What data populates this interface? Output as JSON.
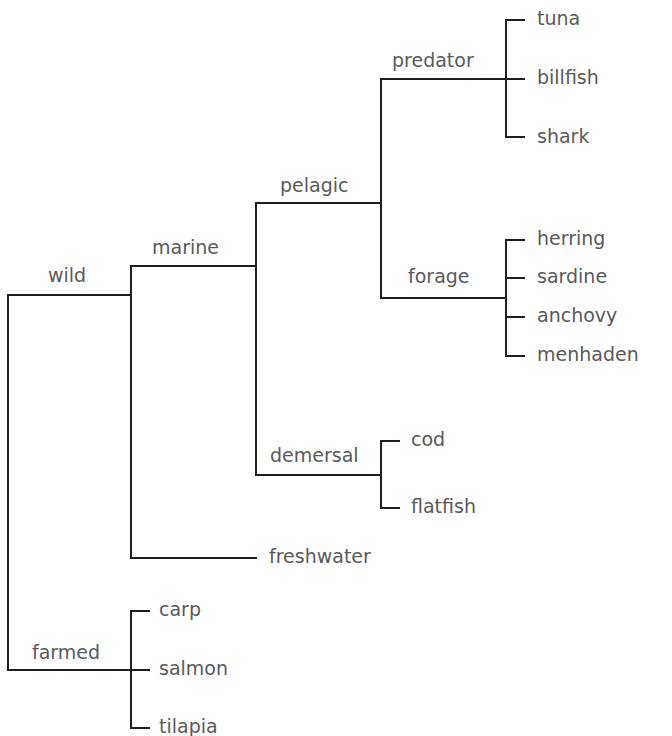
{
  "diagram": {
    "type": "tree",
    "orientation": "left-to-right",
    "colors": {
      "line": "#1f1f1f",
      "text": "#5a5a5a",
      "background": "#ffffff"
    },
    "root": {
      "children": [
        {
          "label": "wild",
          "children": [
            {
              "label": "marine",
              "children": [
                {
                  "label": "pelagic",
                  "children": [
                    {
                      "label": "predator",
                      "children": [
                        "tuna",
                        "billfish",
                        "shark"
                      ]
                    },
                    {
                      "label": "forage",
                      "children": [
                        "herring",
                        "sardine",
                        "anchovy",
                        "menhaden"
                      ]
                    }
                  ]
                },
                {
                  "label": "demersal",
                  "children": [
                    "cod",
                    "flatfish"
                  ]
                }
              ]
            },
            {
              "label": "freshwater"
            }
          ]
        },
        {
          "label": "farmed",
          "children": [
            "carp",
            "salmon",
            "tilapia"
          ]
        }
      ]
    }
  },
  "labels": {
    "wild": "wild",
    "marine": "marine",
    "pelagic": "pelagic",
    "predator": "predator",
    "forage": "forage",
    "demersal": "demersal",
    "freshwater": "freshwater",
    "farmed": "farmed",
    "tuna": "tuna",
    "billfish": "billfish",
    "shark": "shark",
    "herring": "herring",
    "sardine": "sardine",
    "anchovy": "anchovy",
    "menhaden": "menhaden",
    "cod": "cod",
    "flatfish": "flatfish",
    "carp": "carp",
    "salmon": "salmon",
    "tilapia": "tilapia"
  }
}
